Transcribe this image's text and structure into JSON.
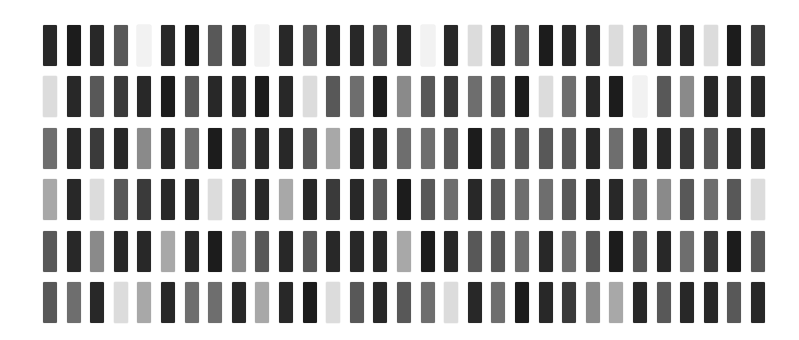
{
  "grid": {
    "rows": 6,
    "cols": 31,
    "origin_x": 43,
    "origin_y": 25,
    "col_pitch": 23.6,
    "row_pitch": 51.4,
    "cell_width": 14,
    "cell_height": 41,
    "palette": [
      "#f2f2f2",
      "#dcdcdc",
      "#a8a8a8",
      "#8a8a8a",
      "#6e6e6e",
      "#585858",
      "#3a3a3a",
      "#282828",
      "#1c1c1c"
    ],
    "values": [
      [
        7,
        8,
        7,
        5,
        0,
        7,
        8,
        5,
        7,
        0,
        7,
        5,
        7,
        7,
        5,
        7,
        0,
        7,
        1,
        7,
        5,
        8,
        7,
        6,
        1,
        4,
        7,
        7,
        1,
        8,
        6
      ],
      [
        1,
        7,
        5,
        6,
        7,
        8,
        5,
        7,
        7,
        8,
        7,
        1,
        5,
        4,
        8,
        3,
        5,
        6,
        4,
        5,
        8,
        1,
        4,
        7,
        8,
        0,
        5,
        3,
        7,
        7,
        7
      ],
      [
        4,
        7,
        6,
        7,
        3,
        7,
        4,
        8,
        5,
        7,
        7,
        5,
        2,
        7,
        7,
        4,
        4,
        5,
        8,
        5,
        5,
        5,
        5,
        7,
        4,
        7,
        7,
        6,
        5,
        7,
        7
      ],
      [
        2,
        7,
        1,
        5,
        6,
        7,
        7,
        1,
        5,
        7,
        2,
        7,
        6,
        7,
        5,
        8,
        5,
        4,
        7,
        5,
        4,
        4,
        5,
        7,
        7,
        4,
        3,
        5,
        4,
        5,
        1
      ],
      [
        5,
        7,
        3,
        7,
        7,
        2,
        7,
        8,
        3,
        5,
        7,
        5,
        7,
        7,
        7,
        2,
        8,
        7,
        5,
        5,
        4,
        7,
        4,
        5,
        8,
        5,
        7,
        4,
        6,
        8,
        5
      ],
      [
        5,
        4,
        7,
        1,
        2,
        7,
        4,
        4,
        7,
        2,
        7,
        8,
        1,
        5,
        7,
        5,
        4,
        1,
        7,
        4,
        8,
        7,
        6,
        3,
        2,
        7,
        5,
        7,
        7,
        5,
        7
      ]
    ]
  }
}
